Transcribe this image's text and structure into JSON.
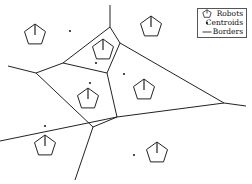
{
  "diagram": {
    "title": "",
    "colors": {
      "line": "#222222",
      "background": "#ffffff"
    },
    "legend": {
      "items": [
        {
          "icon": "pentagon-robot-icon",
          "label": "Robots"
        },
        {
          "icon": "dot-centroid-icon",
          "label": "Centroids"
        },
        {
          "icon": "line-border-icon",
          "label": "Borders"
        }
      ]
    },
    "robots": [
      {
        "x": 35,
        "y": 35
      },
      {
        "x": 103,
        "y": 50
      },
      {
        "x": 151,
        "y": 27
      },
      {
        "x": 88,
        "y": 99
      },
      {
        "x": 144,
        "y": 90
      },
      {
        "x": 45,
        "y": 146
      },
      {
        "x": 157,
        "y": 153
      }
    ],
    "centroids": [
      {
        "x": 70,
        "y": 31
      },
      {
        "x": 96,
        "y": 63
      },
      {
        "x": 124,
        "y": 74
      },
      {
        "x": 90,
        "y": 83
      },
      {
        "x": 45,
        "y": 126
      },
      {
        "x": 134,
        "y": 155
      }
    ],
    "borders": [
      [
        [
          110,
          5
        ],
        [
          110,
          27
        ]
      ],
      [
        [
          110,
          27
        ],
        [
          63,
          63
        ]
      ],
      [
        [
          110,
          27
        ],
        [
          120,
          43
        ]
      ],
      [
        [
          120,
          43
        ],
        [
          224,
          103
        ]
      ],
      [
        [
          120,
          43
        ],
        [
          107,
          73
        ]
      ],
      [
        [
          63,
          63
        ],
        [
          107,
          73
        ]
      ],
      [
        [
          63,
          63
        ],
        [
          36,
          73
        ]
      ],
      [
        [
          36,
          73
        ],
        [
          8,
          66
        ]
      ],
      [
        [
          36,
          73
        ],
        [
          93,
          127
        ]
      ],
      [
        [
          107,
          73
        ],
        [
          117,
          117
        ]
      ],
      [
        [
          117,
          117
        ],
        [
          93,
          127
        ]
      ],
      [
        [
          93,
          127
        ],
        [
          75,
          180
        ]
      ],
      [
        [
          117,
          117
        ],
        [
          224,
          103
        ]
      ],
      [
        [
          224,
          103
        ],
        [
          246,
          106
        ]
      ],
      [
        [
          117,
          117
        ],
        [
          0,
          141
        ]
      ]
    ]
  }
}
